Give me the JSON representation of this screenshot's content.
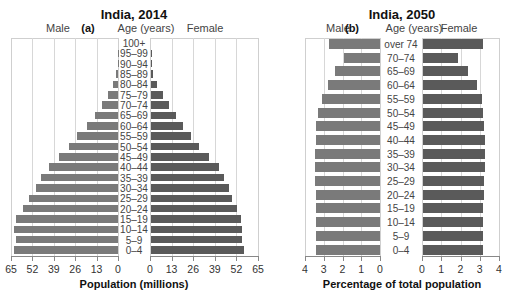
{
  "chart_data": [
    {
      "type": "bar",
      "subtype": "population-pyramid",
      "panel": "(a)",
      "title": "India, 2014",
      "center_label": "Age (years)",
      "left_label": "Male",
      "right_label": "Female",
      "xlabel": "Population (millions)",
      "ylabel": "Age (years)",
      "xlim": [
        0,
        65
      ],
      "xticks": [
        0,
        13,
        26,
        39,
        52,
        65
      ],
      "grid": true,
      "categories": [
        "100+",
        "95–99",
        "90–94",
        "85–89",
        "80–84",
        "75–79",
        "70–74",
        "65–69",
        "60–64",
        "55–59",
        "50–54",
        "45–49",
        "40–44",
        "35–39",
        "30–34",
        "25–29",
        "20–24",
        "15–19",
        "10–14",
        "5–9",
        "0–4"
      ],
      "series": [
        {
          "name": "Male",
          "color": "#7a7a7a",
          "values": [
            0,
            0.1,
            0.3,
            1,
            3,
            6,
            10,
            14,
            19,
            25,
            30,
            36,
            42,
            47,
            50,
            54,
            58,
            62,
            63,
            62,
            63
          ]
        },
        {
          "name": "Female",
          "color": "#5a5a5a",
          "values": [
            0,
            0.2,
            0.5,
            1.5,
            3.5,
            7,
            11,
            15,
            19,
            24,
            29,
            35,
            41,
            44,
            47,
            49,
            52,
            54,
            55,
            55,
            56
          ]
        }
      ]
    },
    {
      "type": "bar",
      "subtype": "population-pyramid",
      "panel": "(b)",
      "title": "India, 2050",
      "center_label": "Age (years)",
      "left_label": "Male",
      "right_label": "Female",
      "xlabel": "Percentage of total population",
      "ylabel": "Age (years)",
      "xlim": [
        0,
        4
      ],
      "xticks": [
        0,
        1,
        2,
        3,
        4
      ],
      "grid": true,
      "categories": [
        "over 74",
        "70–74",
        "65–69",
        "60–64",
        "55–59",
        "50–54",
        "45–49",
        "40–44",
        "35–39",
        "30–34",
        "25–29",
        "20–24",
        "15–19",
        "10–14",
        "5–9",
        "0–4"
      ],
      "series": [
        {
          "name": "Male",
          "color": "#7a7a7a",
          "values": [
            2.7,
            1.9,
            2.4,
            2.8,
            3.1,
            3.3,
            3.4,
            3.4,
            3.45,
            3.45,
            3.45,
            3.4,
            3.4,
            3.4,
            3.4,
            3.4
          ]
        },
        {
          "name": "Female",
          "color": "#5a5a5a",
          "values": [
            3.1,
            1.8,
            2.35,
            2.8,
            3.05,
            3.1,
            3.15,
            3.2,
            3.2,
            3.2,
            3.15,
            3.15,
            3.1,
            3.1,
            3.1,
            3.1
          ]
        }
      ]
    }
  ]
}
